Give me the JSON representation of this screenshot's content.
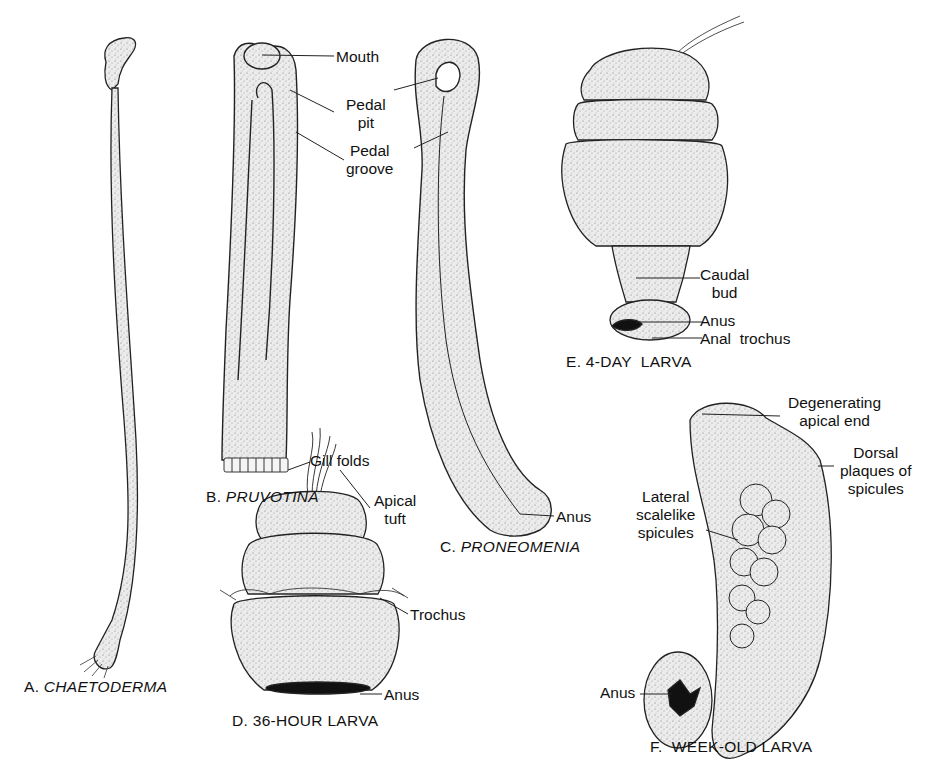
{
  "figure": {
    "panels": [
      {
        "id": "A",
        "caption_prefix": "A.",
        "caption_name": "CHAETODERMA",
        "italic": true,
        "labels": []
      },
      {
        "id": "B",
        "caption_prefix": "B.",
        "caption_name": "PRUVOTINA",
        "italic": true,
        "labels": [
          "Mouth",
          "Pedal",
          "pit",
          "Pedal",
          "groove",
          "Gill folds"
        ]
      },
      {
        "id": "C",
        "caption_prefix": "C.",
        "caption_name": "PRONEOMENIA",
        "italic": true,
        "labels": [
          "Anus"
        ]
      },
      {
        "id": "D",
        "caption_prefix": "D.",
        "caption_name": "36-HOUR LARVA",
        "italic": false,
        "labels": [
          "Apical",
          "tuft",
          "Trochus",
          "Anus"
        ]
      },
      {
        "id": "E",
        "caption_prefix": "E.",
        "caption_name": "4-DAY LARVA",
        "italic": false,
        "labels": [
          "Caudal",
          "bud",
          "Anus",
          "Anal trochus"
        ]
      },
      {
        "id": "F",
        "caption_prefix": "F.",
        "caption_name": "WEEK-OLD LARVA",
        "italic": false,
        "labels": [
          "Degenerating",
          "apical end",
          "Dorsal",
          "plaques of",
          "spicules",
          "Lateral",
          "scalelike",
          "spicules",
          "Anus"
        ]
      }
    ]
  },
  "labels": {
    "b_mouth": "Mouth",
    "b_pedal_pit_1": "Pedal",
    "b_pedal_pit_2": "pit",
    "b_pedal_groove_1": "Pedal",
    "b_pedal_groove_2": "groove",
    "b_gill_folds": "Gill folds",
    "c_anus": "Anus",
    "d_apical_1": "Apical",
    "d_apical_2": "tuft",
    "d_trochus": "Trochus",
    "d_anus": "Anus",
    "e_caudal_1": "Caudal",
    "e_caudal_2": "bud",
    "e_anus": "Anus",
    "e_anal_trochus": "Anal  trochus",
    "f_degen_1": "Degenerating",
    "f_degen_2": "apical end",
    "f_dorsal_1": "Dorsal",
    "f_dorsal_2": "plaques of",
    "f_dorsal_3": "spicules",
    "f_lateral_1": "Lateral",
    "f_lateral_2": "scalelike",
    "f_lateral_3": "spicules",
    "f_anus": "Anus"
  },
  "captions": {
    "a_prefix": "A.",
    "a_name": "CHAETODERMA",
    "b_prefix": "B.",
    "b_name": "PRUVOTINA",
    "c_prefix": "C.",
    "c_name": "PRONEOMENIA",
    "d": "D. 36-HOUR LARVA",
    "e": "E. 4-DAY  LARVA",
    "f": "F.  WEEK-OLD LARVA"
  },
  "colors": {
    "ink": "#111111",
    "stipple_fill": "#e4e4e4",
    "background": "#ffffff"
  }
}
